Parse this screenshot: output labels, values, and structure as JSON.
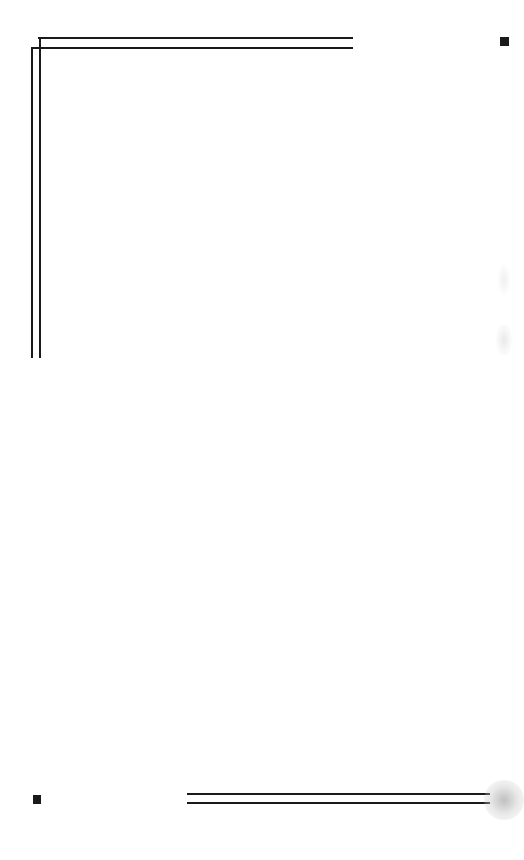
{
  "page": {
    "type": "blank-scanned-page",
    "background": "#ffffff",
    "ink_color": "#1a1a1a"
  },
  "frame": {
    "top_left_corner": "double-rule-corner",
    "bottom_rule": "double-horizontal-rule"
  },
  "registration_marks": [
    {
      "position": "top-right"
    },
    {
      "position": "bottom-left"
    }
  ]
}
